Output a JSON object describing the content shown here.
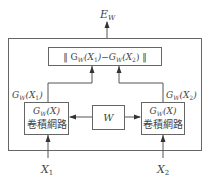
{
  "diagram": {
    "output_label": {
      "base": "E",
      "sub": "W"
    },
    "distance_box": {
      "text_left": "‖ G",
      "sub1": "W",
      "mid1": "(X",
      "sub2": "1",
      "mid2": ")−G",
      "sub3": "W",
      "mid3": "(X",
      "sub4": "2",
      "end": ") ‖"
    },
    "left_output_label": {
      "base": "G",
      "sub": "W",
      "arg": "(X",
      "argsub": "1",
      "close": ")"
    },
    "right_output_label": {
      "base": "G",
      "sub": "W",
      "arg": "(X",
      "argsub": "2",
      "close": ")"
    },
    "left_network": {
      "line1_base": "G",
      "line1_sub": "W",
      "line1_arg": "(X)",
      "line2": "卷積網路"
    },
    "right_network": {
      "line1_base": "G",
      "line1_sub": "W",
      "line1_arg": "(X)",
      "line2": "卷積網路"
    },
    "shared_weights": {
      "label": "W"
    },
    "input_left": {
      "base": "X",
      "sub": "1"
    },
    "input_right": {
      "base": "X",
      "sub": "2"
    },
    "colors": {
      "stroke": "#555555",
      "text": "#444444",
      "background": "#ffffff"
    }
  }
}
